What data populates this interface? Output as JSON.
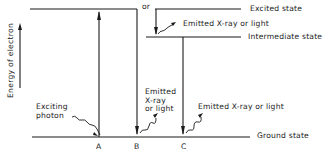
{
  "diagram": {
    "axis_label": "Energy of electron",
    "levels": {
      "excited": "Excited state",
      "intermediate": "Intermediate state",
      "ground": "Ground state"
    },
    "or_label": "or",
    "transitions": {
      "A": {
        "label": "A",
        "annotation_line1": "Exciting",
        "annotation_line2": "photon"
      },
      "B": {
        "label": "B",
        "annotation_line1": "Emitted",
        "annotation_line2": "X-ray",
        "annotation_line3": "or light"
      },
      "C": {
        "label": "C",
        "annotation": "Emitted X-ray or light"
      },
      "upper": {
        "annotation": "Emitted X-ray or light"
      }
    }
  }
}
